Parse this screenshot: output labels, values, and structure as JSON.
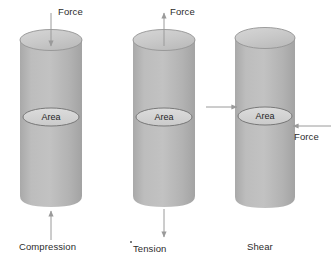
{
  "figure": {
    "background_color": "#ffffff",
    "body_color": "#b4b4b4",
    "top_color": "#c8c8c8",
    "edge_color": "#8f8f8f",
    "area_fill": "#d2d2d2",
    "area_stroke": "#6f6f6f",
    "arrow_color": "#9a9a9a",
    "text_color": "#2b2b2b"
  },
  "panels": [
    {
      "id": "compression",
      "caption": "Compression",
      "area_label": "Area",
      "force_top_label": "Force",
      "force_bottom_label": "",
      "top_arrow_direction": "down",
      "bottom_arrow_direction": "up"
    },
    {
      "id": "tension",
      "caption": "Tension",
      "area_label": "Area",
      "force_top_label": "Force",
      "force_bottom_label": "",
      "top_arrow_direction": "up",
      "bottom_arrow_direction": "down"
    },
    {
      "id": "shear",
      "caption": "Shear",
      "area_label": "Area",
      "force_left_label": "",
      "force_right_label": "Force",
      "left_arrow_direction": "right",
      "right_arrow_direction": "left"
    }
  ]
}
